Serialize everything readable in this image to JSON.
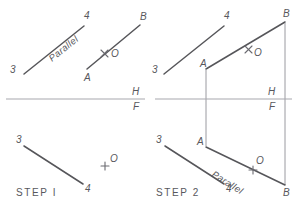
{
  "figure": {
    "width": 295,
    "height": 208,
    "background_color": "#ffffff",
    "line_color": "#56565a",
    "reference_line_color": "#a8a8ae",
    "projection_line_color": "#9a9aa0",
    "text_color": "#58585d"
  },
  "step1": {
    "caption": "STEP  I",
    "top_view": {
      "line_34": {
        "label_3": "3",
        "label_4": "4"
      },
      "line_AB": {
        "label_A": "A",
        "label_B": "B"
      },
      "annotation": "Parallel",
      "point_O": "O"
    },
    "front_view": {
      "line_34": {
        "label_3": "3",
        "label_4": "4"
      },
      "point_O": "O"
    },
    "reference": {
      "horizontal": "H",
      "frontal": "F"
    }
  },
  "step2": {
    "caption": "STEP  2",
    "top_view": {
      "line_34": {
        "label_3": "4"
      },
      "label_3": "3",
      "label_4": "4",
      "line_AB": {
        "label_A": "A",
        "label_B": "B"
      },
      "point_O": "O"
    },
    "front_view": {
      "label_3": "3",
      "label_4": "4",
      "label_A": "A",
      "label_B": "B",
      "annotation": "Parallel",
      "point_O": "O"
    },
    "reference": {
      "horizontal": "H",
      "frontal": "F"
    }
  }
}
